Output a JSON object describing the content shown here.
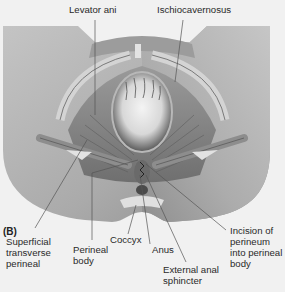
{
  "figure": {
    "panel_label": "(B)",
    "style": "grayscale anatomical illustration",
    "colors": {
      "background": "#f1f1f1",
      "tissue": "#b4b4b4",
      "muscle": "#8a8a8a",
      "leader_line": "#555555",
      "text": "#2a2a2a"
    }
  },
  "labels": {
    "levator_ani": "Levator ani",
    "ischiocavernosus": "Ischiocavernosus",
    "superficial_transverse_perineal": "Superficial\ntransverse\nperineal",
    "perineal_body": "Perineal\nbody",
    "coccyx": "Coccyx",
    "anus": "Anus",
    "external_anal_sphincter": "External anal\nsphincter",
    "incision": "Incision of\nperineum\ninto perineal\nbody"
  }
}
